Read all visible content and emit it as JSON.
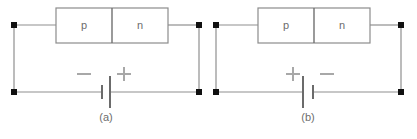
{
  "figure": {
    "width": 417,
    "height": 139,
    "background_color": "#ffffff",
    "wire_color": "#8f8f8f",
    "node_color": "#101010",
    "sign_color": "#a8a8a8",
    "plate_color": "#6b6b6b",
    "text_color": "#6d6d6d"
  },
  "circuits": [
    {
      "id": "circuit-a",
      "caption": "(a)",
      "bias": "reverse",
      "diode": {
        "p_label": "p",
        "n_label": "n"
      },
      "battery": {
        "left_terminal_sign": "−",
        "right_terminal_sign": "+",
        "left_plate": "short",
        "right_plate": "long"
      }
    },
    {
      "id": "circuit-b",
      "caption": "(b)",
      "bias": "forward",
      "diode": {
        "p_label": "p",
        "n_label": "n"
      },
      "battery": {
        "left_terminal_sign": "+",
        "right_terminal_sign": "−",
        "left_plate": "long",
        "right_plate": "short"
      }
    }
  ]
}
